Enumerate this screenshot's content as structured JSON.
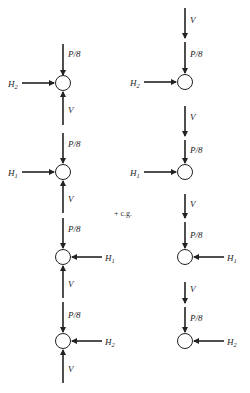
{
  "diagram": {
    "type": "free-body-diagram",
    "center_label": "+ c.g.",
    "labels": {
      "load": "P/8",
      "vertical_shear": "V",
      "h1": "H",
      "h1_sub": "1",
      "h2": "H",
      "h2_sub": "2"
    },
    "columns": [
      {
        "name": "left",
        "nodes": [
          {
            "horizontal": "H2",
            "h_side": "left",
            "v_above": "P/8",
            "v_below": "V (up)"
          },
          {
            "horizontal": "H1",
            "h_side": "left",
            "v_above": "P/8",
            "v_below": "V (up)"
          },
          {
            "horizontal": "H1",
            "h_side": "right",
            "v_above": "P/8",
            "v_below": "V (up)"
          },
          {
            "horizontal": "H2",
            "h_side": "right",
            "v_above": "P/8",
            "v_below": "V (up)"
          }
        ]
      },
      {
        "name": "right",
        "nodes": [
          {
            "horizontal": "H2",
            "h_side": "left",
            "v_above": [
              "V",
              "P/8"
            ]
          },
          {
            "horizontal": "H1",
            "h_side": "left",
            "v_above": [
              "V",
              "P/8"
            ]
          },
          {
            "horizontal": "H1",
            "h_side": "right",
            "v_above": [
              "V",
              "P/8"
            ]
          },
          {
            "horizontal": "H2",
            "h_side": "right",
            "v_above": [
              "V",
              "P/8"
            ]
          }
        ]
      }
    ]
  }
}
